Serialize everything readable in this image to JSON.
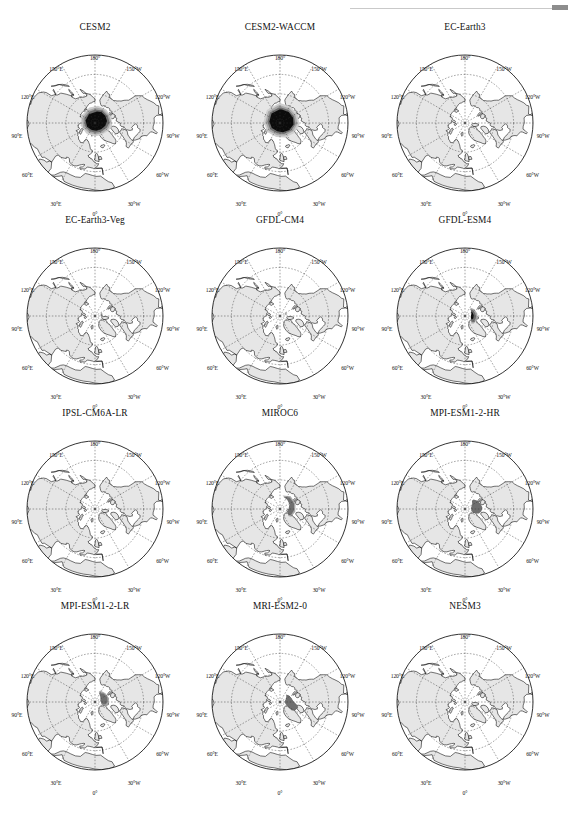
{
  "figure": {
    "type": "multi-panel-map-grid",
    "rows": 4,
    "cols": 3,
    "projection": "North Polar Stereographic",
    "colors": {
      "land": "#e6e6e6",
      "ocean": "#ffffff",
      "coastline": "#000000",
      "graticule": "#333333",
      "ice_dark": "#0b0b0b",
      "ice_mid": "#6f6f6f",
      "ice_light": "#a8a8a8",
      "ice_faint": "#cfcfcf",
      "frame": "#000000",
      "text": "#111111"
    },
    "lon_labels": [
      {
        "text": "180°",
        "pos": "top"
      },
      {
        "text": "150°W",
        "pos": "upper-left"
      },
      {
        "text": "120°W",
        "pos": "left-upper"
      },
      {
        "text": "90°W",
        "pos": "left"
      },
      {
        "text": "60°W",
        "pos": "left-lower"
      },
      {
        "text": "30°W",
        "pos": "lower-left"
      },
      {
        "text": "0°",
        "pos": "bottom"
      },
      {
        "text": "30°E",
        "pos": "lower-right"
      },
      {
        "text": "60°E",
        "pos": "right-lower"
      },
      {
        "text": "90°E",
        "pos": "right"
      },
      {
        "text": "120°E",
        "pos": "right-upper"
      },
      {
        "text": "150°E",
        "pos": "upper-right"
      }
    ]
  },
  "panels": [
    {
      "id": "cesm2",
      "title": "CESM2",
      "row": 0,
      "col": 0,
      "ice_extent": "very-large",
      "ice_description": "Large dark near-black ice mass covering central Arctic Ocean extending toward North America, with gray halo on the Pacific/Siberian side"
    },
    {
      "id": "cesm2-waccm",
      "title": "CESM2-WACCM",
      "row": 0,
      "col": 1,
      "ice_extent": "very-large",
      "ice_description": "Largest dark ice mass, near-black, covering most of the central Arctic basin with gray fringe"
    },
    {
      "id": "ec-earth3",
      "title": "EC-Earth3",
      "row": 0,
      "col": 2,
      "ice_extent": "none",
      "ice_description": "No visible ice shading"
    },
    {
      "id": "ec-earth3-veg",
      "title": "EC-Earth3-Veg",
      "row": 1,
      "col": 0,
      "ice_extent": "tiny",
      "ice_description": "Very small light gray speck near the pole toward Canadian archipelago"
    },
    {
      "id": "gfdl-cm4",
      "title": "GFDL-CM4",
      "row": 1,
      "col": 1,
      "ice_extent": "tiny",
      "ice_description": "Small faint gray sliver just north-west of the pole"
    },
    {
      "id": "gfdl-esm4",
      "title": "GFDL-ESM4",
      "row": 1,
      "col": 2,
      "ice_extent": "medium",
      "ice_description": "Medium gray triangular patch centered near the pole, extending toward Greenland"
    },
    {
      "id": "ipsl-cm6a-lr",
      "title": "IPSL-CM6A-LR",
      "row": 2,
      "col": 0,
      "ice_extent": "none",
      "ice_description": "No visible ice shading"
    },
    {
      "id": "miroc6",
      "title": "MIROC6",
      "row": 2,
      "col": 1,
      "ice_extent": "medium-large",
      "ice_description": "Broad medium-gray patch spanning the pole toward the Beaufort Sea"
    },
    {
      "id": "mpi-esm1-2-hr",
      "title": "MPI-ESM1-2-HR",
      "row": 2,
      "col": 2,
      "ice_extent": "medium-large",
      "ice_description": "Solid medium-gray blob west of the pole straddling 90°W meridian"
    },
    {
      "id": "mpi-esm1-2-lr",
      "title": "MPI-ESM1-2-LR",
      "row": 3,
      "col": 0,
      "ice_extent": "medium",
      "ice_description": "Medium gray rounded patch north of the pole"
    },
    {
      "id": "mri-esm2-0",
      "title": "MRI-ESM2-0",
      "row": 3,
      "col": 1,
      "ice_extent": "medium-large",
      "ice_description": "Dark near-black elongated patch along the Canadian archipelago / Greenland side"
    },
    {
      "id": "nesm3",
      "title": "NESM3",
      "row": 3,
      "col": 2,
      "ice_extent": "none",
      "ice_description": "No visible ice shading"
    }
  ]
}
